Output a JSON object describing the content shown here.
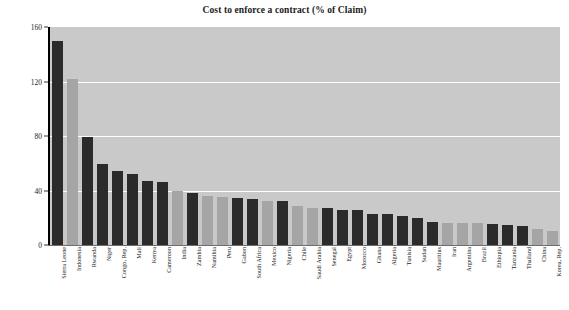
{
  "chart_data": {
    "type": "bar",
    "title": "Cost to enforce a contract (% of Claim)",
    "xlabel": "",
    "ylabel": "",
    "ylim": [
      0,
      160
    ],
    "yticks": [
      0,
      40,
      80,
      120,
      160
    ],
    "grid": true,
    "legend": null,
    "categories": [
      "Sierra Leone",
      "Indonesia",
      "Rwanda",
      "Niger",
      "Congo, Rep.",
      "Mali",
      "Kenya",
      "Cameroon",
      "India",
      "Zambia",
      "Namibia",
      "Peru",
      "Gabon",
      "South Africa",
      "Mexico",
      "Nigeria",
      "Chile",
      "Saudi Arabia",
      "Senegal",
      "Egypt",
      "Morocco",
      "Ghana",
      "Algeria",
      "Tunisia",
      "Sudan",
      "Mauritius",
      "Iran",
      "Argentina",
      "Brazil",
      "Ethiopia",
      "Tanzania",
      "Thailand",
      "China",
      "Korea, Rep."
    ],
    "values": [
      149.5,
      122.0,
      79.0,
      59.5,
      54.0,
      52.0,
      47.0,
      46.5,
      39.5,
      38.5,
      36.0,
      35.5,
      34.5,
      33.5,
      32.0,
      32.0,
      28.5,
      27.5,
      27.0,
      26.0,
      25.5,
      23.0,
      22.5,
      21.5,
      20.0,
      17.0,
      16.5,
      16.5,
      16.0,
      15.5,
      15.0,
      14.0,
      11.5,
      10.5
    ],
    "bar_colors": [
      "dark",
      "light",
      "dark",
      "dark",
      "dark",
      "dark",
      "dark",
      "dark",
      "light",
      "dark",
      "light",
      "light",
      "dark",
      "dark",
      "light",
      "dark",
      "light",
      "light",
      "dark",
      "dark",
      "dark",
      "dark",
      "dark",
      "dark",
      "dark",
      "dark",
      "light",
      "light",
      "light",
      "dark",
      "dark",
      "dark",
      "light",
      "light"
    ]
  },
  "style": {
    "plot_background": "#c9c9c9",
    "bar_dark": "#2b2b2b",
    "bar_light": "#a5a5a5",
    "gridline_color": "#ffffff",
    "page_background": "#ffffff",
    "text_color": "#1a1a1a"
  }
}
